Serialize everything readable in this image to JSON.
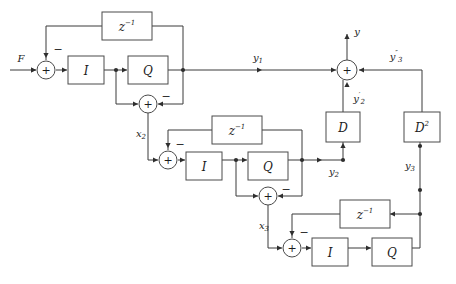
{
  "diagram": {
    "type": "block-diagram",
    "width": 456,
    "height": 284,
    "background_color": "#ffffff",
    "line_color": "#3a3a3a",
    "text_color": "#1c1c1c"
  },
  "blocks": [
    {
      "id": "delay1",
      "label": "z",
      "exponent": "−1",
      "x": 102,
      "y": 12,
      "w": 50,
      "h": 28,
      "stage": 1
    },
    {
      "id": "int1",
      "label": "I",
      "exponent": "",
      "x": 68,
      "y": 56,
      "w": 36,
      "h": 28,
      "stage": 1
    },
    {
      "id": "quant1",
      "label": "Q",
      "exponent": "",
      "x": 128,
      "y": 56,
      "w": 40,
      "h": 28,
      "stage": 1
    },
    {
      "id": "delay2",
      "label": "z",
      "exponent": "−1",
      "x": 212,
      "y": 116,
      "w": 50,
      "h": 28,
      "stage": 2
    },
    {
      "id": "int2",
      "label": "I",
      "exponent": "",
      "x": 186,
      "y": 152,
      "w": 36,
      "h": 28,
      "stage": 2
    },
    {
      "id": "quant2",
      "label": "Q",
      "exponent": "",
      "x": 248,
      "y": 152,
      "w": 40,
      "h": 28,
      "stage": 2
    },
    {
      "id": "delay3",
      "label": "z",
      "exponent": "−1",
      "x": 340,
      "y": 200,
      "w": 50,
      "h": 28,
      "stage": 3
    },
    {
      "id": "int3",
      "label": "I",
      "exponent": "",
      "x": 312,
      "y": 238,
      "w": 36,
      "h": 28,
      "stage": 3
    },
    {
      "id": "quant3",
      "label": "Q",
      "exponent": "",
      "x": 372,
      "y": 238,
      "w": 40,
      "h": 28,
      "stage": 3
    },
    {
      "id": "diff1",
      "label": "D",
      "exponent": "",
      "x": 326,
      "y": 112,
      "w": 34,
      "h": 30,
      "stage": "output"
    },
    {
      "id": "diff2",
      "label": "D",
      "exponent": "2",
      "x": 404,
      "y": 112,
      "w": 36,
      "h": 30,
      "stage": "output"
    }
  ],
  "summers": [
    {
      "id": "sum-input-1",
      "cx": 46,
      "cy": 70,
      "r": 9,
      "stage": 1,
      "signs": [
        {
          "text": "−",
          "x": 58,
          "y": 50
        }
      ]
    },
    {
      "id": "sum-error-1",
      "cx": 148,
      "cy": 104,
      "r": 9,
      "stage": 1,
      "signs": [
        {
          "text": "−",
          "x": 166,
          "y": 97
        }
      ]
    },
    {
      "id": "sum-input-2",
      "cx": 168,
      "cy": 160,
      "r": 9,
      "stage": 2,
      "signs": [
        {
          "text": "−",
          "x": 180,
          "y": 145
        }
      ]
    },
    {
      "id": "sum-error-2",
      "cx": 268,
      "cy": 196,
      "r": 9,
      "stage": 2,
      "signs": [
        {
          "text": "−",
          "x": 286,
          "y": 190
        }
      ]
    },
    {
      "id": "sum-input-3",
      "cx": 292,
      "cy": 248,
      "r": 9,
      "stage": 3,
      "signs": [
        {
          "text": "−",
          "x": 304,
          "y": 233
        }
      ]
    },
    {
      "id": "sum-output",
      "cx": 347,
      "cy": 70,
      "r": 10,
      "stage": "output",
      "signs": []
    }
  ],
  "signals": [
    {
      "id": "input-F",
      "text": "F",
      "sub": "",
      "sup": "",
      "x": 21,
      "y": 59
    },
    {
      "id": "label-x2",
      "text": "x",
      "sub": "2",
      "sup": "",
      "x": 141,
      "y": 134
    },
    {
      "id": "label-x3",
      "text": "x",
      "sub": "3",
      "sup": "",
      "x": 264,
      "y": 226
    },
    {
      "id": "label-y1",
      "text": "y",
      "sub": "1",
      "sup": "",
      "x": 258,
      "y": 58
    },
    {
      "id": "label-y",
      "text": "y",
      "sub": "",
      "sup": "",
      "x": 357,
      "y": 32
    },
    {
      "id": "label-y2prime",
      "text": "y",
      "sub": "2",
      "sup": "′",
      "x": 359,
      "y": 99
    },
    {
      "id": "label-y3dprime",
      "text": "y",
      "sub": "3",
      "sup": "″",
      "x": 396,
      "y": 57
    },
    {
      "id": "label-y2",
      "text": "y",
      "sub": "2",
      "sup": "",
      "x": 334,
      "y": 172
    },
    {
      "id": "label-y3",
      "text": "y",
      "sub": "3",
      "sup": "",
      "x": 410,
      "y": 166
    }
  ],
  "wires": [
    {
      "id": "wire-F-to-sum1",
      "d": "M 10 70 L 36 70"
    },
    {
      "id": "wire-sum1-to-int1",
      "d": "M 56 70 L 67 70"
    },
    {
      "id": "wire-int1-to-node",
      "d": "M 104 70 L 127 70"
    },
    {
      "id": "wire-quant1-to-node",
      "d": "M 168 70 L 183 70"
    },
    {
      "id": "wire-stage1-out-right",
      "d": "M 183 70 L 336 70"
    },
    {
      "id": "wire-fb1-up",
      "d": "M 183 70 L 183 26"
    },
    {
      "id": "wire-fb1-top",
      "d": "M 183 26 L 152 26"
    },
    {
      "id": "wire-fb1-left",
      "d": "M 102 26 L 46 26"
    },
    {
      "id": "wire-fb1-down",
      "d": "M 46 26 L 46 60"
    },
    {
      "id": "wire-tap1-down",
      "d": "M 116 70 L 116 104"
    },
    {
      "id": "wire-tap1-to-err",
      "d": "M 116 104 L 138 104"
    },
    {
      "id": "wire-q1out-down",
      "d": "M 183 70 L 183 104"
    },
    {
      "id": "wire-q1out-to-err",
      "d": "M 183 104 L 158 104"
    },
    {
      "id": "wire-err1-down",
      "d": "M 148 113 L 148 160"
    },
    {
      "id": "wire-err1-to-sum2",
      "d": "M 148 160 L 158 160"
    },
    {
      "id": "wire-sum2-to-int2",
      "d": "M 178 160 L 185 160"
    },
    {
      "id": "wire-int2-to-node",
      "d": "M 222 160 L 247 160"
    },
    {
      "id": "wire-quant2-to-node",
      "d": "M 288 160 L 302 160"
    },
    {
      "id": "wire-stage2-out-right",
      "d": "M 302 160 L 343 160"
    },
    {
      "id": "wire-y2-up-to-D",
      "d": "M 343 160 L 343 142"
    },
    {
      "id": "wire-fb2-up",
      "d": "M 302 160 L 302 130"
    },
    {
      "id": "wire-fb2-top",
      "d": "M 302 130 L 262 130"
    },
    {
      "id": "wire-fb2-left",
      "d": "M 212 130 L 168 130"
    },
    {
      "id": "wire-fb2-down",
      "d": "M 168 130 L 168 150"
    },
    {
      "id": "wire-tap2-down",
      "d": "M 236 160 L 236 196"
    },
    {
      "id": "wire-tap2-to-err",
      "d": "M 236 196 L 258 196"
    },
    {
      "id": "wire-q2out-down",
      "d": "M 302 160 L 302 196"
    },
    {
      "id": "wire-q2out-to-err",
      "d": "M 302 196 L 278 196"
    },
    {
      "id": "wire-err2-down",
      "d": "M 268 205 L 268 248"
    },
    {
      "id": "wire-err2-to-sum3",
      "d": "M 268 248 L 282 248"
    },
    {
      "id": "wire-sum3-to-int3",
      "d": "M 302 248 L 311 248"
    },
    {
      "id": "wire-int3-to-quant3",
      "d": "M 348 248 L 371 248"
    },
    {
      "id": "wire-quant3-out",
      "d": "M 412 248 L 420 248"
    },
    {
      "id": "wire-y3-vertical",
      "d": "M 420 248 L 420 142"
    },
    {
      "id": "wire-fb3-from-y3",
      "d": "M 420 214 L 390 214"
    },
    {
      "id": "wire-fb3-left",
      "d": "M 340 214 L 292 214"
    },
    {
      "id": "wire-fb3-down",
      "d": "M 292 214 L 292 238"
    },
    {
      "id": "wire-D2-up",
      "d": "M 422 112 L 422 70"
    },
    {
      "id": "wire-D2-to-sum",
      "d": "M 422 70 L 359 70"
    },
    {
      "id": "wire-D-up-to-sum",
      "d": "M 343 112 L 343 80"
    },
    {
      "id": "wire-y-out-up",
      "d": "M 347 60 L 347 34"
    }
  ],
  "arrows": [
    {
      "id": "arrow-F-in",
      "x": 36,
      "y": 70,
      "dir": "right"
    },
    {
      "id": "arrow-sum1-in",
      "x": 36,
      "y": 70,
      "dir": "right"
    },
    {
      "id": "arrow-int1-in",
      "x": 67,
      "y": 70,
      "dir": "right"
    },
    {
      "id": "arrow-quant1-in",
      "x": 127,
      "y": 70,
      "dir": "right"
    },
    {
      "id": "arrow-fb1-into-sum",
      "x": 46,
      "y": 58,
      "dir": "down"
    },
    {
      "id": "arrow-err1-left-in",
      "x": 138,
      "y": 104,
      "dir": "right"
    },
    {
      "id": "arrow-err1-right-in",
      "x": 158,
      "y": 104,
      "dir": "left"
    },
    {
      "id": "arrow-y1-mid",
      "x": 262,
      "y": 70,
      "dir": "right"
    },
    {
      "id": "arrow-sum-out-left",
      "x": 336,
      "y": 70,
      "dir": "right"
    },
    {
      "id": "arrow-sum2-in",
      "x": 158,
      "y": 160,
      "dir": "right"
    },
    {
      "id": "arrow-int2-in",
      "x": 185,
      "y": 160,
      "dir": "right"
    },
    {
      "id": "arrow-quant2-in",
      "x": 247,
      "y": 160,
      "dir": "right"
    },
    {
      "id": "arrow-fb2-into-sum",
      "x": 168,
      "y": 148,
      "dir": "down"
    },
    {
      "id": "arrow-err2-left-in",
      "x": 258,
      "y": 196,
      "dir": "right"
    },
    {
      "id": "arrow-err2-right-in",
      "x": 278,
      "y": 196,
      "dir": "left"
    },
    {
      "id": "arrow-sum3-in",
      "x": 282,
      "y": 248,
      "dir": "right"
    },
    {
      "id": "arrow-int3-in",
      "x": 311,
      "y": 248,
      "dir": "right"
    },
    {
      "id": "arrow-quant3-in",
      "x": 371,
      "y": 248,
      "dir": "right"
    },
    {
      "id": "arrow-fb3-into-sum",
      "x": 292,
      "y": 236,
      "dir": "down"
    },
    {
      "id": "arrow-fb3-into-z",
      "x": 390,
      "y": 214,
      "dir": "left"
    },
    {
      "id": "arrow-y2-into-D",
      "x": 343,
      "y": 143,
      "dir": "up"
    },
    {
      "id": "arrow-y2-mid",
      "x": 322,
      "y": 160,
      "dir": "right"
    },
    {
      "id": "arrow-y3dp-into-sum",
      "x": 359,
      "y": 70,
      "dir": "left"
    },
    {
      "id": "arrow-y2p-into-sum",
      "x": 347,
      "y": 82,
      "dir": "up"
    },
    {
      "id": "arrow-y-out",
      "x": 347,
      "y": 34,
      "dir": "up"
    }
  ],
  "junctions": [
    {
      "id": "node-int1-tap",
      "x": 116,
      "y": 70
    },
    {
      "id": "node-q1-out",
      "x": 183,
      "y": 70
    },
    {
      "id": "node-int2-tap",
      "x": 236,
      "y": 160
    },
    {
      "id": "node-q2-out",
      "x": 302,
      "y": 160
    },
    {
      "id": "node-y2-corner",
      "x": 343,
      "y": 160
    },
    {
      "id": "node-y3-fb",
      "x": 420,
      "y": 214
    },
    {
      "id": "node-y3-mid",
      "x": 420,
      "y": 190
    },
    {
      "id": "node-y3-d2",
      "x": 420,
      "y": 146
    }
  ]
}
